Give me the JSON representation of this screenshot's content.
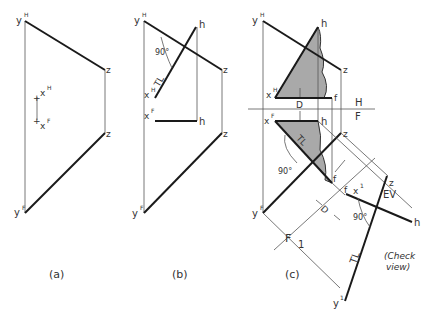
{
  "figure": {
    "panels": [
      {
        "id": "a",
        "caption": "(a)",
        "labels": {
          "yH": "y",
          "yH_sup": "H",
          "yF": "y",
          "yF_sup": "F",
          "z1": "z",
          "z2": "z",
          "xH": "x",
          "xH_sup": "H",
          "xF": "x",
          "xF_sup": "F"
        }
      },
      {
        "id": "b",
        "caption": "(b)",
        "labels": {
          "yH": "y",
          "yH_sup": "H",
          "yF": "y",
          "yF_sup": "F",
          "z1": "z",
          "z2": "z",
          "h1": "h",
          "h2": "h",
          "xH": "x",
          "xH_sup": "H",
          "xF": "x",
          "xF_sup": "F",
          "angle": "90°",
          "tl": "TL"
        }
      },
      {
        "id": "c",
        "caption": "(c)",
        "labels": {
          "yH": "y",
          "yH_sup": "H",
          "yF": "y",
          "yF_sup": "F",
          "y1": "y",
          "y1_sup": "1",
          "z1": "z",
          "z2": "z",
          "z3": "z",
          "h1": "h",
          "h2": "h",
          "h3": "h",
          "f1": "f",
          "f2": "f",
          "f3": "f",
          "xH": "x",
          "xH_sup": "H",
          "xF": "x",
          "xF_sup": "F",
          "x1": "x",
          "x1_sup": "1",
          "D1": "D",
          "D2": "D",
          "H": "H",
          "F": "F",
          "F1": "F",
          "one": "1",
          "angle1": "90°",
          "angle2": "90°",
          "tl1": "TL",
          "tl2": "TL",
          "ev": "EV",
          "note1": "(Check",
          "note2": "view)"
        }
      }
    ]
  }
}
